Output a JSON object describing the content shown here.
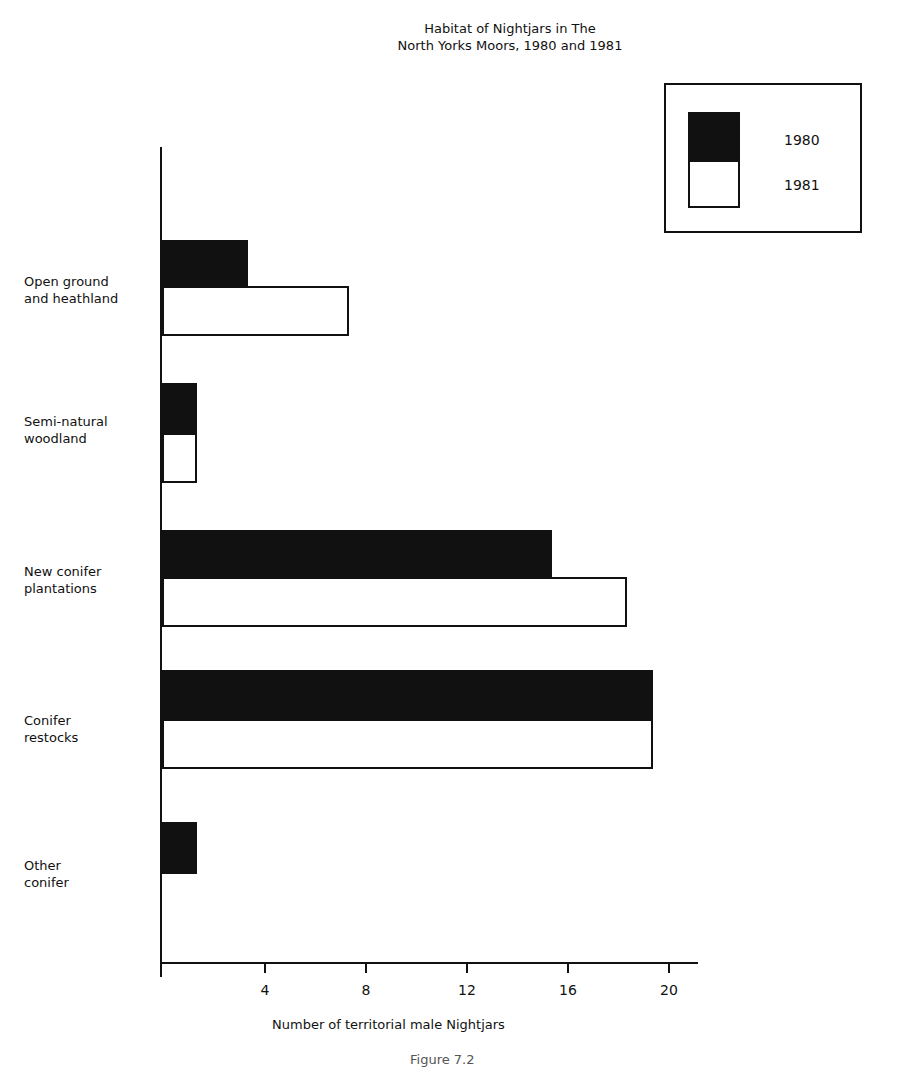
{
  "chart_data": {
    "type": "bar",
    "orientation": "horizontal",
    "title": "Habitat of Nightjars in The North Yorks Moors, 1980 and 1981",
    "title_lines": [
      "Habitat of Nightjars in The",
      "North  Yorks Moors, 1980 and 1981"
    ],
    "categories": [
      "Open ground and heathland",
      "Semi-natural woodland",
      "New conifer plantations",
      "Conifer restocks",
      "Other conifer"
    ],
    "category_lines": [
      [
        "Open ground",
        "and heathland"
      ],
      [
        "Semi-natural",
        "woodland"
      ],
      [
        "New conifer",
        "plantations"
      ],
      [
        "Conifer",
        "restocks"
      ],
      [
        "Other",
        "conifer"
      ]
    ],
    "series": [
      {
        "name": "1980",
        "color": "#111111",
        "values": [
          3,
          1,
          15,
          19,
          1
        ]
      },
      {
        "name": "1981",
        "color": "#ffffff",
        "values": [
          7,
          1,
          18,
          19,
          0
        ]
      }
    ],
    "xlabel": "Number of territorial male Nightjars",
    "ylabel": "",
    "xlim": [
      0,
      21
    ],
    "xticks": [
      4,
      8,
      12,
      16,
      20
    ],
    "grid": false,
    "legend_position": "top-right"
  },
  "legend": {
    "items": [
      "1980",
      "1981"
    ]
  },
  "axis": {
    "ticks": [
      "4",
      "8",
      "12",
      "16",
      "20"
    ]
  },
  "caption": "Figure 7.2"
}
